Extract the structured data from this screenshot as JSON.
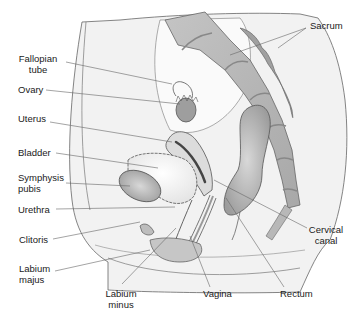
{
  "diagram": {
    "colors": {
      "background": "#ffffff",
      "body_fill": "#f2f2f2",
      "organ_mid": "#c8c8c8",
      "organ_dark": "#9a9a9a",
      "bone": "#b8b8b8",
      "outline": "#555555",
      "leader_line": "#666666",
      "text": "#1a1a1a"
    },
    "labels": {
      "sacrum": "Sacrum",
      "fallopian_tube_1": "Fallopian",
      "fallopian_tube_2": "tube",
      "ovary": "Ovary",
      "uterus": "Uterus",
      "bladder": "Bladder",
      "symphysis_pubis_1": "Symphysis",
      "symphysis_pubis_2": "pubis",
      "urethra": "Urethra",
      "clitoris": "Clitoris",
      "labium_majus_1": "Labium",
      "labium_majus_2": "majus",
      "labium_minus_1": "Labium",
      "labium_minus_2": "minus",
      "vagina": "Vagina",
      "rectum": "Rectum",
      "cervical_canal_1": "Cervical",
      "cervical_canal_2": "canal"
    }
  }
}
